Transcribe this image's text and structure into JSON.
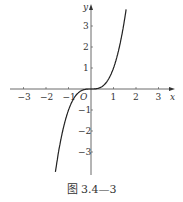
{
  "chart_data": {
    "type": "line",
    "title": "",
    "function": "y = x^3",
    "series": [
      {
        "name": "y=x^3",
        "x": [
          -1.55,
          -1.4,
          -1.2,
          -1.0,
          -0.8,
          -0.6,
          -0.4,
          -0.2,
          0,
          0.2,
          0.4,
          0.6,
          0.8,
          1.0,
          1.2,
          1.4,
          1.55
        ],
        "y": [
          -3.72,
          -2.74,
          -1.73,
          -1.0,
          -0.51,
          -0.22,
          -0.06,
          -0.01,
          0,
          0.01,
          0.06,
          0.22,
          0.51,
          1.0,
          1.73,
          2.74,
          3.72
        ]
      }
    ],
    "xlabel": "x",
    "ylabel": "y",
    "xticks": [
      "-3",
      "-2",
      "-1",
      "1",
      "2",
      "3"
    ],
    "yticks": [
      "3",
      "2",
      "1",
      "-1",
      "-2",
      "-3"
    ],
    "origin_label": "O",
    "xlim": [
      -3.5,
      3.7
    ],
    "ylim": [
      -4,
      4
    ],
    "grid": false
  },
  "caption": "图 3.4—3"
}
